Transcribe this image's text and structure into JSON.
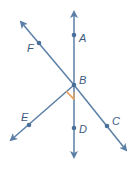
{
  "diagram": {
    "colors": {
      "line": "#5b7fa6",
      "point": "#4a6f99",
      "right_angle": "#e8a15c",
      "label": "#3d5a80"
    },
    "points": [
      {
        "name": "A",
        "x": 74,
        "y": 35
      },
      {
        "name": "B",
        "x": 74,
        "y": 85
      },
      {
        "name": "C",
        "x": 107,
        "y": 126
      },
      {
        "name": "D",
        "x": 74,
        "y": 128
      },
      {
        "name": "E",
        "x": 29,
        "y": 125
      },
      {
        "name": "F",
        "x": 39,
        "y": 43
      }
    ],
    "labels": {
      "A": "A",
      "B": "B",
      "C": "C",
      "D": "D",
      "E": "E",
      "F": "F"
    },
    "lines": [
      {
        "name": "line-AD",
        "type": "line",
        "through": [
          "A",
          "D"
        ]
      },
      {
        "name": "line-FC",
        "type": "line",
        "through": [
          "F",
          "C"
        ]
      },
      {
        "name": "ray-BE",
        "type": "ray",
        "from": "B",
        "through": "E"
      }
    ],
    "right_angle": {
      "vertex": "B",
      "between": [
        "E",
        "D"
      ]
    }
  }
}
